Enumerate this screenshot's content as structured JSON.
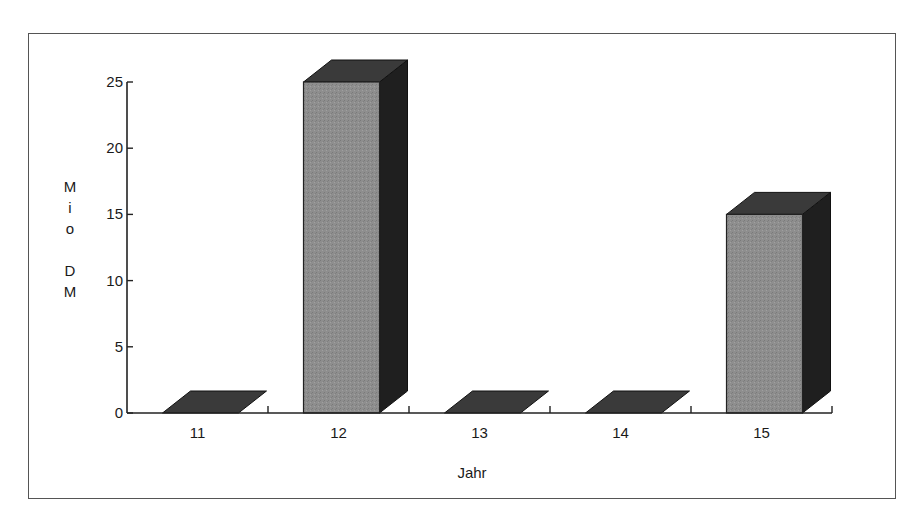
{
  "chart_data": {
    "type": "bar",
    "style": "3d",
    "title": "",
    "xlabel": "Jahr",
    "ylabel": "Mio DM",
    "ylabel_letters": [
      "M",
      "i",
      "o",
      "",
      "D",
      "M"
    ],
    "categories": [
      "11",
      "12",
      "13",
      "14",
      "15"
    ],
    "values": [
      0,
      25,
      0,
      0,
      15
    ],
    "ylim": [
      0,
      25
    ],
    "yticks": [
      0,
      5,
      10,
      15,
      20,
      25
    ],
    "grid": false,
    "legend": null
  },
  "colors": {
    "bar_front": "#8c8c8c",
    "bar_side": "#1f1f1f",
    "bar_top": "#3a3a3a",
    "axis": "#222222",
    "frame": "#555555"
  }
}
